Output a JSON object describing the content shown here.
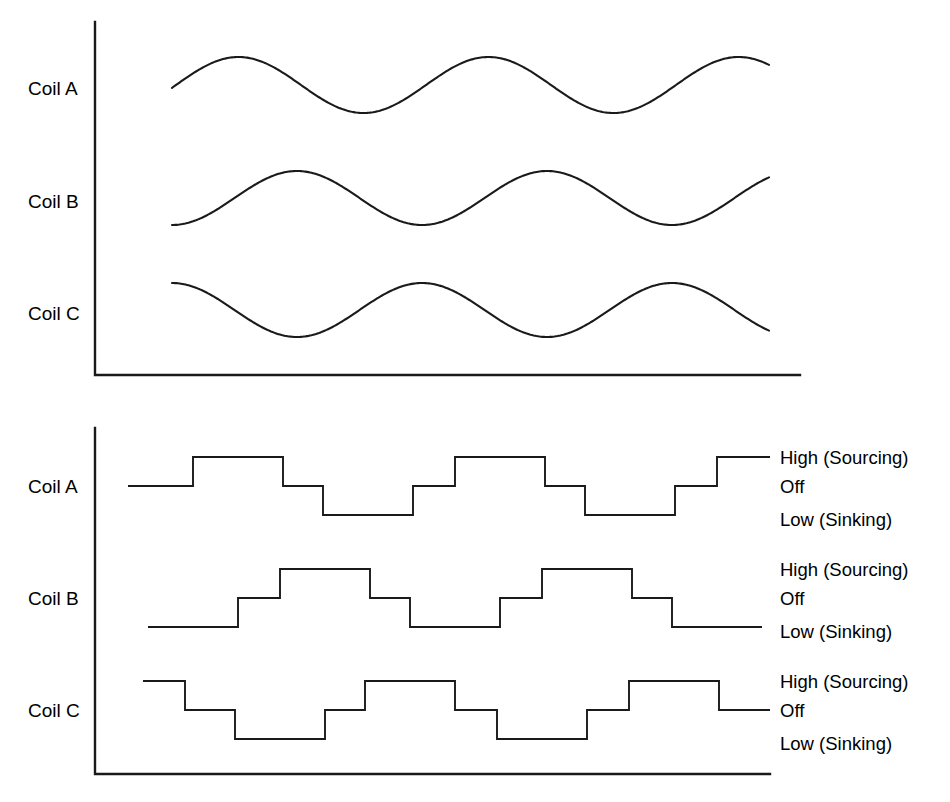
{
  "figure": {
    "title": "",
    "background_color": "#ffffff",
    "line_color": "#1a1a1a",
    "width": 950,
    "height": 802
  },
  "top_chart": {
    "name": "back-emf-sine-waveforms",
    "row_labels": [
      "Coil A",
      "Coil B",
      "Coil C"
    ],
    "axis": {
      "y_axis_x": 95,
      "y_axis_top": 22,
      "x_axis_y": 375,
      "x_axis_right": 800
    }
  },
  "bottom_chart": {
    "name": "drive-commutation-waveforms",
    "row_labels": [
      "Coil A",
      "Coil B",
      "Coil C"
    ],
    "level_labels": [
      "High (Sourcing)",
      "Off",
      "Low (Sinking)"
    ],
    "axis": {
      "y_axis_x": 95,
      "y_axis_top": 428,
      "x_axis_y": 774,
      "x_axis_right": 770
    }
  },
  "chart_data": {
    "type": "line",
    "xlabel": "",
    "ylabel": "",
    "grid": false,
    "legend_position": "right",
    "panels": [
      {
        "name": "sine-back-emf",
        "type": "line",
        "description": "Smooth sinusoidal back-EMF waveforms for three coils, each 120 degrees out of phase",
        "x_range": [
          172,
          770
        ],
        "period_px": 250,
        "cycles": 2.4,
        "series": [
          {
            "name": "Coil A",
            "baseline_y": 85,
            "amplitude": 28,
            "phase_deg": 0,
            "start_value": -0.1,
            "peaks_y": 57,
            "troughs_y": 113
          },
          {
            "name": "Coil B",
            "baseline_y": 198,
            "amplitude": 27,
            "phase_deg": -120,
            "start_value": -1.0,
            "peaks_y": 171,
            "troughs_y": 225
          },
          {
            "name": "Coil C",
            "baseline_y": 310,
            "amplitude": 27,
            "phase_deg": 120,
            "start_value": 1.0,
            "peaks_y": 283,
            "troughs_y": 337
          }
        ]
      },
      {
        "name": "six-step-commutation",
        "type": "step",
        "description": "Six-step trapezoidal drive states for three coils: High (Sourcing), Off, Low (Sinking)",
        "levels": {
          "high": 1,
          "off": 0,
          "low": -1
        },
        "series": [
          {
            "name": "Coil A",
            "baseline_y": 486,
            "high_y": 457,
            "low_y": 515,
            "x_start": 128,
            "x_end": 770,
            "segments": [
              {
                "level": "off",
                "x0": 128,
                "x1": 193
              },
              {
                "level": "high",
                "x0": 193,
                "x1": 283
              },
              {
                "level": "off",
                "x0": 283,
                "x1": 323
              },
              {
                "level": "low",
                "x0": 323,
                "x1": 413
              },
              {
                "level": "off",
                "x0": 413,
                "x1": 455
              },
              {
                "level": "high",
                "x0": 455,
                "x1": 545
              },
              {
                "level": "off",
                "x0": 545,
                "x1": 585
              },
              {
                "level": "low",
                "x0": 585,
                "x1": 675
              },
              {
                "level": "off",
                "x0": 675,
                "x1": 717
              },
              {
                "level": "high",
                "x0": 717,
                "x1": 770
              }
            ]
          },
          {
            "name": "Coil B",
            "baseline_y": 598,
            "high_y": 569,
            "low_y": 627,
            "x_start": 148,
            "x_end": 770,
            "segments": [
              {
                "level": "low",
                "x0": 148,
                "x1": 238
              },
              {
                "level": "off",
                "x0": 238,
                "x1": 280
              },
              {
                "level": "high",
                "x0": 280,
                "x1": 370
              },
              {
                "level": "off",
                "x0": 370,
                "x1": 410
              },
              {
                "level": "low",
                "x0": 410,
                "x1": 500
              },
              {
                "level": "off",
                "x0": 500,
                "x1": 542
              },
              {
                "level": "high",
                "x0": 542,
                "x1": 632
              },
              {
                "level": "off",
                "x0": 632,
                "x1": 672
              },
              {
                "level": "low",
                "x0": 672,
                "x1": 762
              }
            ]
          },
          {
            "name": "Coil C",
            "baseline_y": 710,
            "high_y": 681,
            "low_y": 739,
            "x_start": 143,
            "x_end": 770,
            "segments": [
              {
                "level": "high",
                "x0": 143,
                "x1": 185
              },
              {
                "level": "off",
                "x0": 185,
                "x1": 235
              },
              {
                "level": "low",
                "x0": 235,
                "x1": 325
              },
              {
                "level": "off",
                "x0": 325,
                "x1": 365
              },
              {
                "level": "high",
                "x0": 365,
                "x1": 455
              },
              {
                "level": "off",
                "x0": 455,
                "x1": 497
              },
              {
                "level": "low",
                "x0": 497,
                "x1": 587
              },
              {
                "level": "off",
                "x0": 587,
                "x1": 629
              },
              {
                "level": "high",
                "x0": 629,
                "x1": 719
              },
              {
                "level": "off",
                "x0": 719,
                "x1": 770
              }
            ]
          }
        ]
      }
    ]
  }
}
